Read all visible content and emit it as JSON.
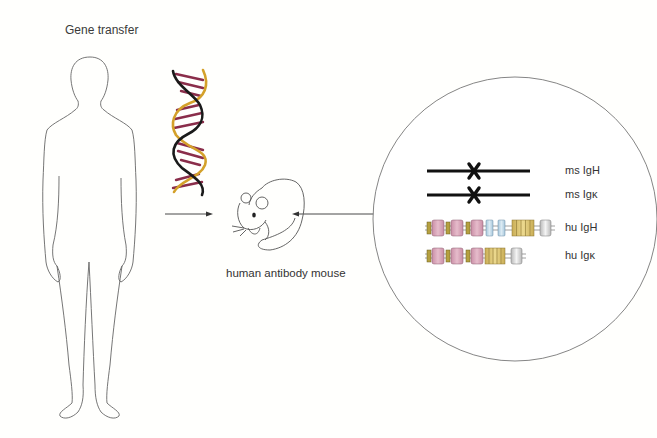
{
  "diagram": {
    "title": "Gene transfer",
    "mouse_label": "human antibody mouse",
    "inset": {
      "rows": [
        {
          "label": "ms IgH",
          "type": "knocked-out"
        },
        {
          "label": "ms Igκ",
          "type": "knocked-out"
        },
        {
          "label": "hu IgH",
          "type": "transgene"
        },
        {
          "label": "hu Igκ",
          "type": "transgene"
        }
      ]
    },
    "colors": {
      "outline": "#555555",
      "dna_strand_a": "#1a1a1a",
      "dna_strand_b": "#d4a12a",
      "dna_rungs": "#8a2d4a",
      "segment_pink": "#d9a3b8",
      "segment_olive": "#b5a040",
      "segment_blue": "#b8d6e6",
      "segment_gold": "#d8c070",
      "segment_grey": "#d4d4d4"
    }
  }
}
